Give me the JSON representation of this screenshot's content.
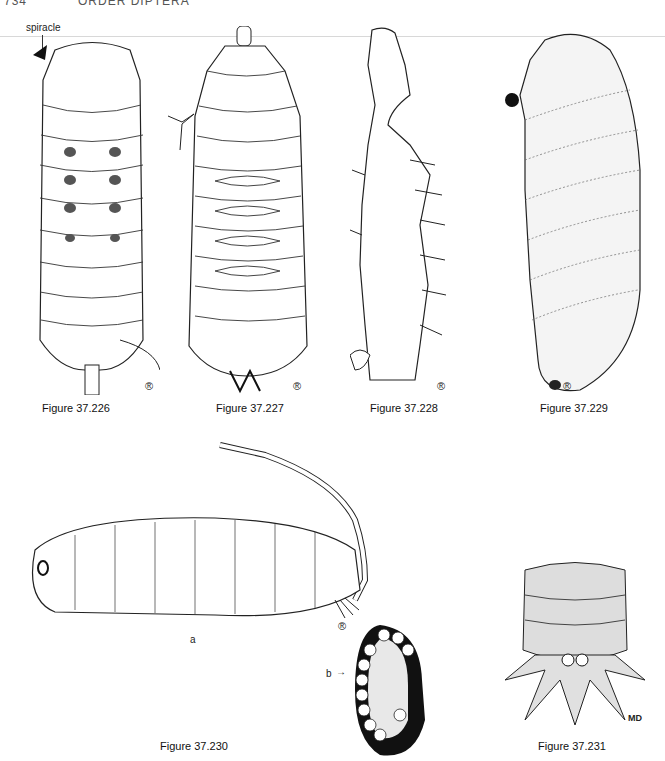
{
  "page": {
    "header_page_number": "734",
    "header_title": "ORDER DIPTERA"
  },
  "figures": [
    {
      "id": "fig-37-226",
      "caption": "Figure 37.226",
      "annotations": [
        "spiracle"
      ],
      "mark": "®"
    },
    {
      "id": "fig-37-227",
      "caption": "Figure 37.227",
      "mark": "®"
    },
    {
      "id": "fig-37-228",
      "caption": "Figure 37.228",
      "mark": "®"
    },
    {
      "id": "fig-37-229",
      "caption": "Figure 37.229",
      "mark": "®"
    },
    {
      "id": "fig-37-230",
      "caption": "Figure 37.230",
      "parts": [
        "a",
        "b"
      ],
      "mark": "®"
    },
    {
      "id": "fig-37-231",
      "caption": "Figure 37.231",
      "artist_initials": "MD"
    }
  ],
  "labels": {
    "spiracle": "spiracle",
    "part_a": "a",
    "part_b": "b",
    "arrow": "→",
    "md": "MD"
  }
}
